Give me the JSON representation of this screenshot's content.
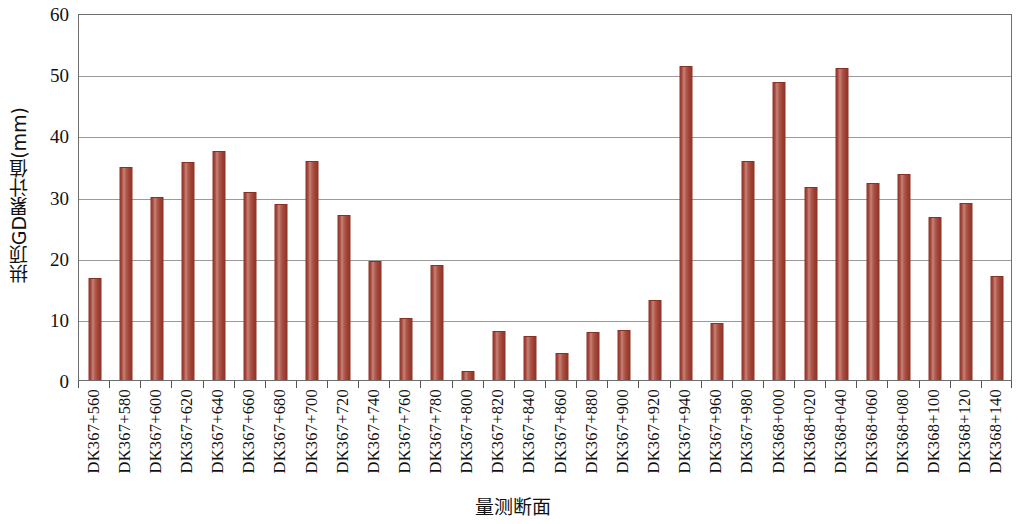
{
  "chart_data": {
    "type": "bar",
    "title": "",
    "xlabel": "量测断面",
    "ylabel": "拱顶GD累计值(mm)",
    "ylim": [
      0,
      60
    ],
    "yticks": [
      0,
      10,
      20,
      30,
      40,
      50,
      60
    ],
    "grid": true,
    "legend": "none",
    "bar_color": "#A64236",
    "axis_color": "#6E6E6E",
    "gridline_color": "#9A9A9A",
    "categories": [
      "DK367+560",
      "DK367+580",
      "DK367+600",
      "DK367+620",
      "DK367+640",
      "DK367+660",
      "DK367+680",
      "DK367+700",
      "DK367+720",
      "DK367+740",
      "DK367+760",
      "DK367+780",
      "DK367+800",
      "DK367+820",
      "DK367+840",
      "DK367+860",
      "DK367+880",
      "DK367+900",
      "DK367+920",
      "DK367+940",
      "DK367+960",
      "DK367+980",
      "DK368+000",
      "DK368+020",
      "DK368+040",
      "DK368+060",
      "DK368+080",
      "DK368+100",
      "DK368+120",
      "DK368+140"
    ],
    "values": [
      16.7,
      34.8,
      29.9,
      35.6,
      37.4,
      30.7,
      28.7,
      35.8,
      26.9,
      19.4,
      10.1,
      18.8,
      1.4,
      8.0,
      7.2,
      4.4,
      7.8,
      8.2,
      13.0,
      51.3,
      9.3,
      35.8,
      48.8,
      31.6,
      51.0,
      32.2,
      33.6,
      26.7,
      28.9,
      17.0
    ]
  }
}
